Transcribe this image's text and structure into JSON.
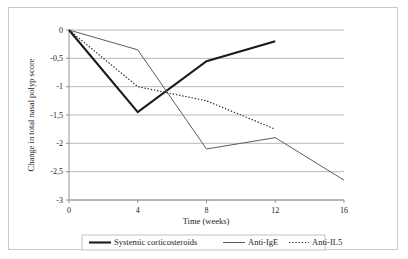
{
  "chart_data": {
    "type": "line",
    "title": "",
    "xlabel": "Time (weeks)",
    "ylabel": "Change in total nasal polyp score",
    "xlim": [
      0,
      16
    ],
    "ylim": [
      -3,
      0
    ],
    "xticks": [
      "0",
      "4",
      "8",
      "12",
      "16"
    ],
    "xtick_values": [
      0,
      4,
      8,
      12,
      16
    ],
    "yticks": [
      "0",
      "-0,5",
      "-1",
      "-1,5",
      "-2",
      "-2,5",
      "-3"
    ],
    "ytick_values": [
      0,
      -0.5,
      -1,
      -1.5,
      -2,
      -2.5,
      -3
    ],
    "grid": true,
    "legend_position": "bottom",
    "series": [
      {
        "name": "Systemic corticosteroids",
        "style": "thick-solid",
        "color": "#1a1a1a",
        "x": [
          0,
          4,
          8,
          12
        ],
        "values": [
          0,
          -1.45,
          -0.55,
          -0.2
        ]
      },
      {
        "name": "Anti-IgE",
        "style": "thin-solid",
        "color": "#5d5d5d",
        "x": [
          0,
          4,
          8,
          12,
          16
        ],
        "values": [
          0,
          -0.35,
          -2.1,
          -1.9,
          -2.65
        ]
      },
      {
        "name": "Anti-IL5",
        "style": "dotted",
        "color": "#2b2b2b",
        "x": [
          0,
          4,
          8,
          12
        ],
        "values": [
          0,
          -1.0,
          -1.25,
          -1.75
        ]
      }
    ]
  },
  "legend": {
    "items": [
      {
        "label": "Systemic corticosteroids"
      },
      {
        "label": "Anti-IgE"
      },
      {
        "label": "Anti-IL5"
      }
    ]
  },
  "axes": {
    "x_title": "Time (weeks)",
    "y_title": "Change in total nasal polyp score"
  }
}
